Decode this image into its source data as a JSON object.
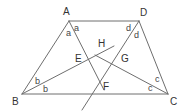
{
  "figure": {
    "type": "trapezoid-with-angle-bisectors",
    "line_color": "#6e6e6e",
    "text_color": "#333333"
  },
  "vertices": [
    {
      "id": "A",
      "label": "A"
    },
    {
      "id": "D",
      "label": "D"
    },
    {
      "id": "B",
      "label": "B"
    },
    {
      "id": "C",
      "label": "C"
    }
  ],
  "intersections": [
    {
      "id": "E",
      "label": "E"
    },
    {
      "id": "H",
      "label": "H"
    },
    {
      "id": "G",
      "label": "G"
    },
    {
      "id": "F",
      "label": "F"
    }
  ],
  "angle_labels": {
    "A": [
      "a",
      "a"
    ],
    "D": [
      "d",
      "d"
    ],
    "B": [
      "b",
      "b"
    ],
    "C": [
      "c",
      "c"
    ]
  },
  "sides": [
    "AD",
    "DC",
    "CB",
    "BA"
  ],
  "bisectors": [
    {
      "from": "A",
      "through": [
        "E",
        "F"
      ]
    },
    {
      "from": "D",
      "through": [
        "G",
        "F"
      ]
    },
    {
      "from": "B",
      "through": [
        "E",
        "H"
      ]
    },
    {
      "from": "C",
      "through": [
        "G",
        "H"
      ]
    }
  ]
}
